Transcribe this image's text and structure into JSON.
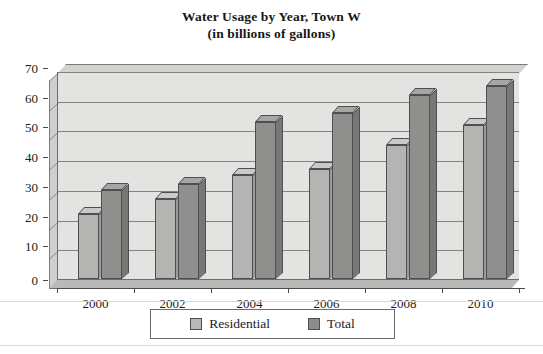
{
  "chart_data": {
    "type": "bar",
    "title": "Water Usage by Year, Town W",
    "subtitle": "(in billions of gallons)",
    "title_lines": [
      "Water Usage by Year, Town W",
      "(in billions of gallons)"
    ],
    "xlabel": "",
    "ylabel": "",
    "categories": [
      "2000",
      "2002",
      "2004",
      "2006",
      "2008",
      "2010"
    ],
    "series": [
      {
        "name": "Residential",
        "color": "#b4b4b2",
        "values": [
          22,
          27,
          35,
          37,
          45,
          52
        ]
      },
      {
        "name": "Total",
        "color": "#8f8f8d",
        "values": [
          30,
          32,
          53,
          56,
          62,
          65
        ]
      }
    ],
    "ylim": [
      0,
      70
    ],
    "ytick_values": [
      0,
      10,
      20,
      30,
      40,
      50,
      60,
      70
    ],
    "ytick_labels": [
      "0",
      "10",
      "20",
      "30",
      "40",
      "50",
      "60",
      "70"
    ],
    "grid": true,
    "legend_position": "bottom",
    "legend_entries": [
      "Residential",
      "Total"
    ],
    "style": "3d-grouped-bar"
  },
  "legend": {
    "items": [
      {
        "label": "Residential",
        "swatch": "res"
      },
      {
        "label": "Total",
        "swatch": "tot"
      }
    ]
  }
}
